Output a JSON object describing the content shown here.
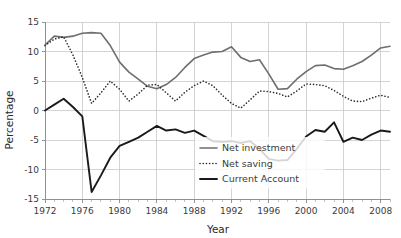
{
  "chart_data": {
    "type": "line",
    "title": "",
    "xlabel": "Year",
    "ylabel": "Percentage",
    "xlim": [
      1972,
      2009
    ],
    "ylim": [
      -15,
      15
    ],
    "grid": true,
    "legend_position": "bottom-center-right",
    "x_major_ticks": [
      1972,
      1976,
      1980,
      1984,
      1988,
      1992,
      1996,
      2000,
      2004,
      2008
    ],
    "x_tick_labels": [
      "1972",
      "1976",
      "1980",
      "1984",
      "1988",
      "1992",
      "1996",
      "2000",
      "2004",
      "2008"
    ],
    "y_ticks": [
      -15,
      -10,
      -5,
      0,
      5,
      10,
      15
    ],
    "y_tick_labels": [
      "-15",
      "-10",
      "-5",
      "0",
      "5",
      "10",
      "15"
    ],
    "x": [
      1972,
      1973,
      1974,
      1975,
      1976,
      1977,
      1978,
      1979,
      1980,
      1981,
      1982,
      1983,
      1984,
      1985,
      1986,
      1987,
      1988,
      1989,
      1990,
      1991,
      1992,
      1993,
      1994,
      1995,
      1996,
      1997,
      1998,
      1999,
      2000,
      2001,
      2002,
      2003,
      2004,
      2005,
      2006,
      2007,
      2008,
      2009
    ],
    "series": [
      {
        "name": "Net investment",
        "style": "solid",
        "color": "#6e6e6e",
        "values": [
          11.1,
          12.6,
          12.4,
          12.6,
          13.1,
          13.2,
          13.1,
          11.0,
          8.2,
          6.5,
          5.3,
          4.1,
          3.7,
          4.4,
          5.6,
          7.3,
          8.8,
          9.4,
          9.9,
          10.0,
          10.8,
          9.0,
          8.3,
          8.6,
          6.2,
          3.6,
          3.7,
          5.3,
          6.6,
          7.6,
          7.7,
          7.1,
          7.0,
          7.6,
          8.3,
          9.4,
          10.6,
          10.9
        ],
        "values_note": "approximate, read from gridlines"
      },
      {
        "name": "Net saving",
        "style": "dotted",
        "color": "#2b2b2b",
        "values": [
          11.0,
          12.1,
          12.5,
          9.4,
          5.6,
          1.2,
          3.0,
          5.0,
          3.6,
          1.6,
          2.8,
          4.3,
          4.4,
          3.0,
          1.6,
          3.1,
          4.2,
          5.0,
          4.2,
          2.6,
          1.2,
          0.4,
          1.8,
          3.3,
          3.2,
          2.9,
          2.3,
          3.3,
          4.5,
          4.4,
          4.2,
          3.4,
          2.4,
          1.6,
          1.5,
          2.1,
          2.6,
          2.2
        ],
        "values_note": "approximate, read from gridlines"
      },
      {
        "name": "Current Account",
        "style": "solid-bold",
        "color": "#1a1a1a",
        "values": [
          0.0,
          1.0,
          2.0,
          0.6,
          -1.0,
          -13.8,
          -11.0,
          -8.0,
          -6.0,
          -5.3,
          -4.6,
          -3.6,
          -2.6,
          -3.4,
          -3.2,
          -3.8,
          -3.4,
          -4.3,
          -5.2,
          -5.3,
          -5.2,
          -5.5,
          -5.2,
          -6.5,
          -8.2,
          -8.5,
          -8.4,
          -6.5,
          -4.4,
          -3.3,
          -3.6,
          -2.0,
          -5.3,
          -4.6,
          -5.0,
          -4.1,
          -3.4,
          -3.6
        ],
        "values_note": "approximate, read from gridlines"
      }
    ],
    "legend": [
      {
        "label": "Net investment",
        "style": "solid",
        "color": "#6e6e6e"
      },
      {
        "label": "Net saving",
        "style": "dotted",
        "color": "#2b2b2b"
      },
      {
        "label": "Current Account",
        "style": "solid-bold",
        "color": "#1a1a1a"
      }
    ]
  }
}
